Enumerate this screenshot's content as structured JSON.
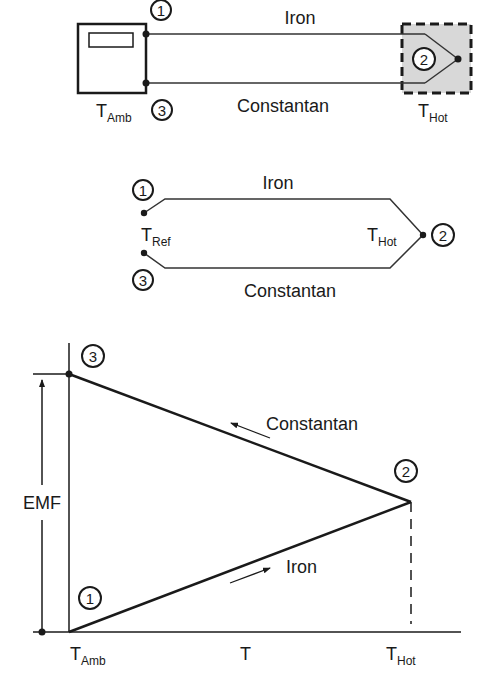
{
  "colors": {
    "ink": "#1a1a1a",
    "junction_fill": "#d8d8d8",
    "background": "#ffffff"
  },
  "top_circuit": {
    "wire_top_label": "Iron",
    "wire_bottom_label": "Constantan",
    "meter_temp_label": "T",
    "meter_temp_sub": "Amb",
    "hot_temp_label": "T",
    "hot_temp_sub": "Hot",
    "node1": "1",
    "node2": "2",
    "node3": "3"
  },
  "middle_circuit": {
    "wire_top_label": "Iron",
    "wire_bottom_label": "Constantan",
    "ref_temp_label": "T",
    "ref_temp_sub": "Ref",
    "hot_temp_label": "T",
    "hot_temp_sub": "Hot",
    "node1": "1",
    "node2": "2",
    "node3": "3"
  },
  "emf_graph": {
    "y_label": "EMF",
    "x_label": "T",
    "x_start_label": "T",
    "x_start_sub": "Amb",
    "x_end_label": "T",
    "x_end_sub": "Hot",
    "upper_line_label": "Constantan",
    "lower_line_label": "Iron",
    "node1": "1",
    "node2": "2",
    "node3": "3"
  }
}
